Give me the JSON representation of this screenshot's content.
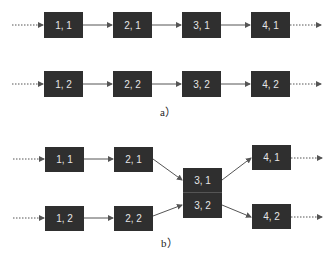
{
  "diagram_a": {
    "caption": "a）",
    "nodes": [
      {
        "id": "1,1",
        "label": "1, 1",
        "x": 44,
        "y": 12
      },
      {
        "id": "2,1",
        "label": "2, 1",
        "x": 113,
        "y": 12
      },
      {
        "id": "3,1",
        "label": "3, 1",
        "x": 182,
        "y": 12
      },
      {
        "id": "4,1",
        "label": "4, 1",
        "x": 251,
        "y": 12
      },
      {
        "id": "1,2",
        "label": "1, 2",
        "x": 44,
        "y": 71
      },
      {
        "id": "2,2",
        "label": "2, 2",
        "x": 113,
        "y": 71
      },
      {
        "id": "3,2",
        "label": "3, 2",
        "x": 182,
        "y": 71
      },
      {
        "id": "4,2",
        "label": "4, 2",
        "x": 251,
        "y": 71
      }
    ]
  },
  "diagram_b": {
    "caption": "b）",
    "nodes": [
      {
        "id": "1,1",
        "label": "1, 1",
        "x": 45,
        "y": 147
      },
      {
        "id": "2,1",
        "label": "2, 1",
        "x": 114,
        "y": 147
      },
      {
        "id": "3,1",
        "label": "3, 1",
        "x": 183,
        "y": 168
      },
      {
        "id": "3,2",
        "label": "3, 2",
        "x": 183,
        "y": 193
      },
      {
        "id": "4,1",
        "label": "4, 1",
        "x": 252,
        "y": 145
      },
      {
        "id": "1,2",
        "label": "1, 2",
        "x": 45,
        "y": 206
      },
      {
        "id": "2,2",
        "label": "2, 2",
        "x": 114,
        "y": 206
      },
      {
        "id": "4,2",
        "label": "4, 2",
        "x": 252,
        "y": 204
      }
    ]
  },
  "colors": {
    "node_fill": "#2f2f2f",
    "node_text": "#e6e6e6",
    "arrow": "#555555"
  }
}
